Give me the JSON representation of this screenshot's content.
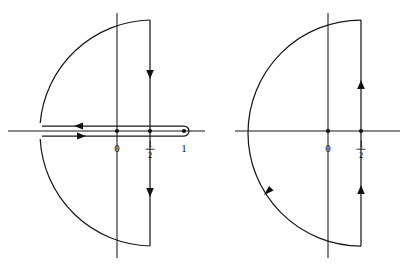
{
  "figure": {
    "background_color": "#ffffff",
    "ink_color": "#1a1a1a",
    "panels": [
      {
        "id": "left-panel",
        "name": "keyhole-contour-diagram",
        "contour_type": "keyhole",
        "orientation": "clockwise",
        "axes": {
          "real_axis": {
            "label": "real-axis",
            "y": 131,
            "x_start": 8,
            "x_end": 205
          },
          "imaginary_axis": {
            "label": "imaginary-axis",
            "x": 117,
            "y_start": 13,
            "y_end": 258
          }
        },
        "marked_points": [
          {
            "label": "0",
            "x": 117,
            "value": 0,
            "dot": true
          },
          {
            "label": "1/2",
            "x": 150,
            "value": 0.5,
            "dot": true,
            "fraction": {
              "numerator": "1",
              "denominator": "2"
            }
          },
          {
            "label": "1",
            "x": 184,
            "value": 1,
            "dot": true
          }
        ],
        "vertical_segment": {
          "x": 150,
          "y_top": 20,
          "y_bottom": 246,
          "direction": "downward"
        },
        "arc": {
          "center_x": 150,
          "radius": 113,
          "opens": "left"
        },
        "branch_cut": {
          "upper_line_y": 126,
          "lower_line_y": 136,
          "loop_center_x": 184,
          "loop_radius": 5,
          "upper_direction": "leftward",
          "lower_direction": "rightward"
        },
        "arrows": [
          {
            "name": "arrow-upper-vertical-down",
            "x": 150,
            "y": 74,
            "direction": "down"
          },
          {
            "name": "arrow-lower-vertical-down",
            "x": 150,
            "y": 192,
            "direction": "down"
          },
          {
            "name": "arrow-upper-cut-left",
            "x": 80,
            "y": 126,
            "direction": "left"
          },
          {
            "name": "arrow-lower-cut-right",
            "x": 80,
            "y": 136,
            "direction": "right"
          }
        ]
      },
      {
        "id": "right-panel",
        "name": "semicircular-contour-diagram",
        "contour_type": "closed-semicircle",
        "orientation": "counterclockwise",
        "axes": {
          "real_axis": {
            "label": "real-axis",
            "y": 131,
            "x_start": 235,
            "x_end": 400
          },
          "imaginary_axis": {
            "label": "imaginary-axis",
            "x": 328,
            "y_start": 13,
            "y_end": 258
          }
        },
        "marked_points": [
          {
            "label": "0",
            "x": 328,
            "value": 0,
            "dot": true
          },
          {
            "label": "1/2",
            "x": 361,
            "value": 0.5,
            "dot": true,
            "fraction": {
              "numerator": "1",
              "denominator": "2"
            }
          }
        ],
        "vertical_segment": {
          "x": 361,
          "y_top": 20,
          "y_bottom": 246,
          "direction": "upward"
        },
        "arc": {
          "center_x": 361,
          "radius": 113,
          "opens": "left"
        },
        "arrows": [
          {
            "name": "arrow-upper-vertical-up",
            "x": 361,
            "y": 85,
            "direction": "up"
          },
          {
            "name": "arrow-lower-vertical-up",
            "x": 361,
            "y": 190,
            "direction": "up"
          },
          {
            "name": "arrow-arc-counterclockwise",
            "x": 268,
            "y": 191,
            "direction": "down-left"
          }
        ]
      }
    ]
  }
}
